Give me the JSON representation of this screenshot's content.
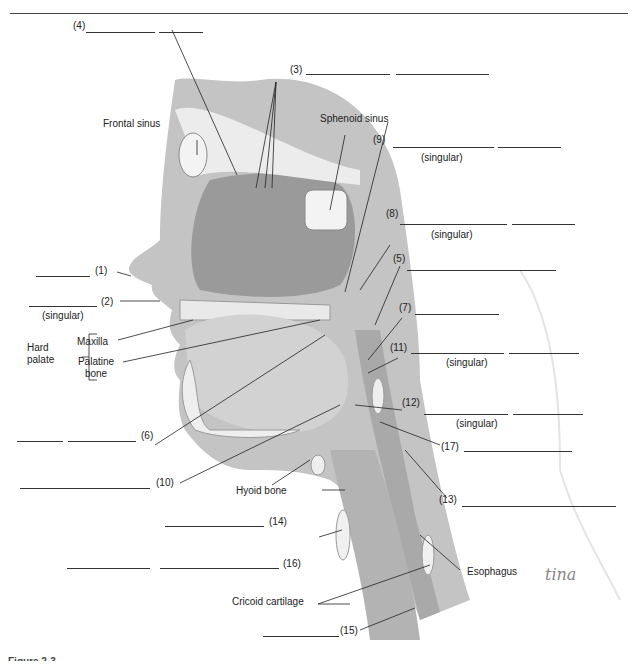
{
  "figure": {
    "type": "anatomical-diagram",
    "caption_partial": "Figure 2-3  ...",
    "signature": "tina"
  },
  "structure_labels": {
    "frontal_sinus": "Frontal sinus",
    "sphenoid_sinus": "Sphenoid sinus",
    "hard_palate": "Hard palate",
    "maxilla": "Maxilla",
    "palatine_bone": "Palatine bone",
    "hyoid_bone": "Hyoid bone",
    "cricoid_cartilage": "Cricoid cartilage",
    "esophagus": "Esophagus"
  },
  "numbered_labels": [
    {
      "num": "(1)",
      "note": ""
    },
    {
      "num": "(2)",
      "note": "(singular)"
    },
    {
      "num": "(3)",
      "note": ""
    },
    {
      "num": "(4)",
      "note": ""
    },
    {
      "num": "(5)",
      "note": ""
    },
    {
      "num": "(6)",
      "note": ""
    },
    {
      "num": "(7)",
      "note": ""
    },
    {
      "num": "(8)",
      "note": "(singular)"
    },
    {
      "num": "(9)",
      "note": "(singular)"
    },
    {
      "num": "(10)",
      "note": ""
    },
    {
      "num": "(11)",
      "note": "(singular)"
    },
    {
      "num": "(12)",
      "note": "(singular)"
    },
    {
      "num": "(13)",
      "note": ""
    },
    {
      "num": "(14)",
      "note": ""
    },
    {
      "num": "(15)",
      "note": ""
    },
    {
      "num": "(16)",
      "note": ""
    },
    {
      "num": "(17)",
      "note": ""
    }
  ],
  "colors": {
    "tissue": "#b9b9b9",
    "tissue_dark": "#8e8e8e",
    "bone": "#efefef",
    "line": "#222222"
  }
}
